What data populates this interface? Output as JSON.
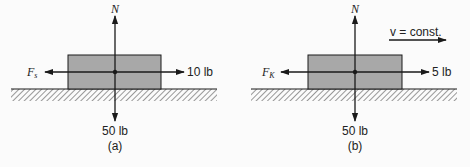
{
  "figure": {
    "colors": {
      "background": "#fbfbfb",
      "block_fill": "#a8a8a8",
      "line": "#1a1a1a",
      "hatch": "#555555"
    },
    "panels": [
      {
        "id": "a",
        "caption": "(a)",
        "normal_force_label": "N",
        "weight_label": "50 lb",
        "friction_label_main": "F",
        "friction_label_sub": "s",
        "applied_force_label": "10 lb"
      },
      {
        "id": "b",
        "caption": "(b)",
        "normal_force_label": "N",
        "weight_label": "50 lb",
        "friction_label_main": "F",
        "friction_label_sub": "K",
        "applied_force_label": "5 lb",
        "velocity_label": "v = const."
      }
    ]
  }
}
